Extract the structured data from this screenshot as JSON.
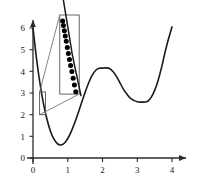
{
  "chart_data": {
    "type": "line",
    "title": "",
    "xlabel": "",
    "ylabel": "",
    "xlim": [
      -0.15,
      4.3
    ],
    "ylim": [
      -0.35,
      6.6
    ],
    "grid": false,
    "legend": null,
    "xticks": [
      0,
      1,
      2,
      3,
      4
    ],
    "xticklabels": [
      "0",
      "1",
      "2",
      "3",
      "4"
    ],
    "yticks": [
      0,
      1,
      2,
      3,
      4,
      5,
      6
    ],
    "yticklabels": [
      "0",
      "1",
      "2",
      "3",
      "4",
      "5",
      "6"
    ],
    "axis_style": "arrow-ended spine axes, ticks outside",
    "series": [
      {
        "name": "objective function",
        "style": "solid black curve",
        "x": [
          0.0,
          0.1,
          0.2,
          0.3,
          0.4,
          0.5,
          0.6,
          0.7,
          0.8,
          0.9,
          1.0,
          1.1,
          1.2,
          1.3,
          1.4,
          1.5,
          1.6,
          1.7,
          1.8,
          1.9,
          2.0,
          2.1,
          2.2,
          2.3,
          2.4,
          2.5,
          2.6,
          2.7,
          2.8,
          2.9,
          3.0,
          3.1,
          3.2,
          3.3,
          3.4,
          3.5,
          3.6,
          3.7,
          3.8,
          3.9,
          4.0
        ],
        "y": [
          6.0,
          4.6,
          3.45,
          2.52,
          1.8,
          1.25,
          0.88,
          0.66,
          0.6,
          0.68,
          0.9,
          1.22,
          1.63,
          2.08,
          2.56,
          3.03,
          3.46,
          3.81,
          4.04,
          4.14,
          4.15,
          4.16,
          4.13,
          3.99,
          3.77,
          3.48,
          3.18,
          2.95,
          2.76,
          2.66,
          2.6,
          2.58,
          2.58,
          2.62,
          2.8,
          3.12,
          3.58,
          4.18,
          4.88,
          5.5,
          6.05
        ]
      },
      {
        "name": "iterates (magnified)",
        "style": "black filled circle markers on steep branch",
        "marker": "o",
        "count": 13,
        "x": [
          0.215,
          0.222,
          0.23,
          0.238,
          0.247,
          0.256,
          0.265,
          0.275,
          0.285,
          0.296,
          0.307,
          0.318,
          0.33
        ],
        "y": [
          2.97,
          2.91,
          2.84,
          2.77,
          2.7,
          2.62,
          2.54,
          2.46,
          2.38,
          2.3,
          2.21,
          2.12,
          2.03
        ]
      }
    ],
    "annotations": [
      {
        "kind": "zoom-source-rect",
        "label": "source region",
        "x0": 0.19,
        "x1": 0.36,
        "y0": 2.0,
        "y1": 3.05
      },
      {
        "kind": "zoom-inset-rect",
        "label": "magnified region",
        "x0": 0.77,
        "x1": 1.33,
        "y0": 2.95,
        "y1": 6.6
      },
      {
        "kind": "zoom-connector",
        "label": "upper connector line"
      },
      {
        "kind": "zoom-connector",
        "label": "lower connector line"
      }
    ]
  },
  "colors": {
    "curve": "#1a1a1a",
    "axis": "#2b2b2b",
    "marker": "#000000",
    "box": "#555555",
    "connector": "#666666",
    "background": "#ffffff"
  }
}
